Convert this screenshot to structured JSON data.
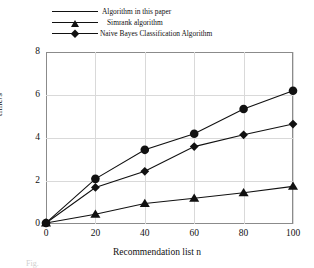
{
  "chart_data": {
    "type": "line",
    "title": "",
    "xlabel": "Recommendation list n",
    "ylabel": "time/s",
    "x": [
      0,
      20,
      40,
      60,
      80,
      100
    ],
    "xlim": [
      0,
      100
    ],
    "ylim": [
      0,
      8
    ],
    "xticks": [
      "0",
      "20",
      "40",
      "60",
      "80",
      "100"
    ],
    "yticks": [
      "0",
      "2",
      "4",
      "6",
      "8"
    ],
    "grid": true,
    "legend_position": "above-plot-left",
    "series": [
      {
        "name": "Algorithm in this paper",
        "marker": "triangle",
        "color": "#111111",
        "values": [
          0.05,
          0.45,
          0.95,
          1.2,
          1.45,
          1.75
        ]
      },
      {
        "name": "Simrank algorithm",
        "marker": "circle",
        "color": "#111111",
        "values": [
          0.05,
          2.1,
          3.45,
          4.2,
          5.35,
          6.2
        ]
      },
      {
        "name": "Naive Bayes Classification Algorithm",
        "marker": "diamond",
        "color": "#111111",
        "values": [
          0.05,
          1.7,
          2.45,
          3.6,
          4.15,
          4.65
        ]
      }
    ]
  },
  "axes": {
    "y_label": "time/s",
    "x_label": "Recommendation list n",
    "y_ticks": [
      "0",
      "2",
      "4",
      "6",
      "8"
    ],
    "x_ticks": [
      "0",
      "20",
      "40",
      "60",
      "80",
      "100"
    ]
  },
  "legend": {
    "entries": [
      {
        "label": "Algorithm in this paper",
        "marker": "triangle-marker"
      },
      {
        "label": "Simrank algorithm",
        "marker": "circle-marker"
      },
      {
        "label": "Naive Bayes Classification Algorithm",
        "marker": "diamond-marker"
      }
    ]
  },
  "caption": {
    "text": "Fig."
  }
}
